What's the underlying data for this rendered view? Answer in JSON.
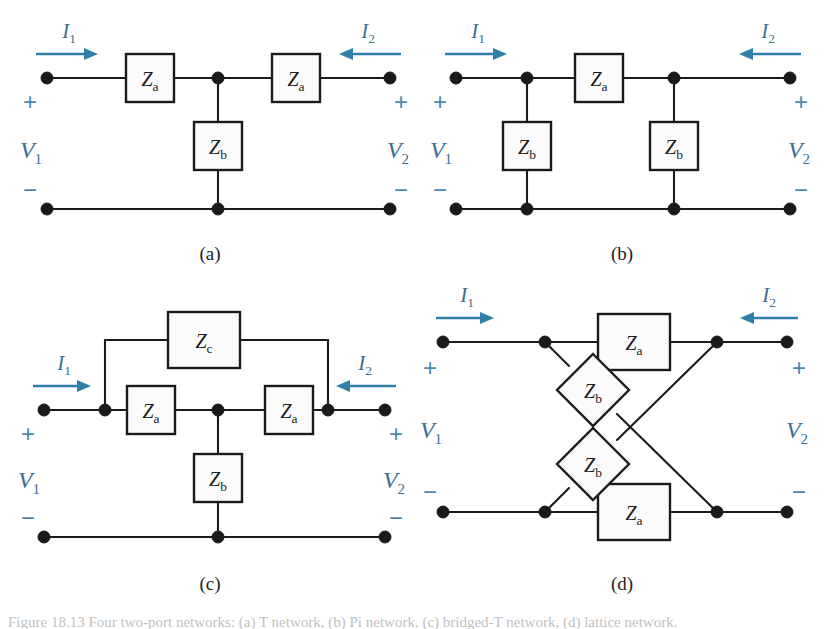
{
  "figure": {
    "background_color": "#ffffff",
    "line_color": "#1b1b1b",
    "accent_color": "#3d6f93",
    "arrow_color": "#2f7fa8",
    "caption_partial": "Figure 18.13  Four two-port networks: (a) T network, (b) Pi network, (c) bridged-T network, (d) lattice network."
  },
  "labels": {
    "i1": "I",
    "i1_sub": "1",
    "i2": "I",
    "i2_sub": "2",
    "v1": "V",
    "v1_sub": "1",
    "v2": "V",
    "v2_sub": "2",
    "plus": "+",
    "minus": "−",
    "z": "Z",
    "sub_a": "a",
    "sub_b": "b",
    "sub_c": "c"
  },
  "panels": [
    {
      "id": "a",
      "caption": "(a)",
      "name": "t-network",
      "impedances": [
        {
          "name": "za-left",
          "label": "Z",
          "sub": "a"
        },
        {
          "name": "za-right",
          "label": "Z",
          "sub": "a"
        },
        {
          "name": "zb-shunt",
          "label": "Z",
          "sub": "b"
        }
      ]
    },
    {
      "id": "b",
      "caption": "(b)",
      "name": "pi-network",
      "impedances": [
        {
          "name": "za-series",
          "label": "Z",
          "sub": "a"
        },
        {
          "name": "zb-shunt-left",
          "label": "Z",
          "sub": "b"
        },
        {
          "name": "zb-shunt-right",
          "label": "Z",
          "sub": "b"
        }
      ]
    },
    {
      "id": "c",
      "caption": "(c)",
      "name": "bridged-t-network",
      "impedances": [
        {
          "name": "zc-bridge",
          "label": "Z",
          "sub": "c"
        },
        {
          "name": "za-left",
          "label": "Z",
          "sub": "a"
        },
        {
          "name": "za-right",
          "label": "Z",
          "sub": "a"
        },
        {
          "name": "zb-shunt",
          "label": "Z",
          "sub": "b"
        }
      ]
    },
    {
      "id": "d",
      "caption": "(d)",
      "name": "lattice-network",
      "impedances": [
        {
          "name": "za-top",
          "label": "Z",
          "sub": "a"
        },
        {
          "name": "za-bottom",
          "label": "Z",
          "sub": "a"
        },
        {
          "name": "zb-cross-up",
          "label": "Z",
          "sub": "b"
        },
        {
          "name": "zb-cross-dn",
          "label": "Z",
          "sub": "b"
        }
      ]
    }
  ]
}
